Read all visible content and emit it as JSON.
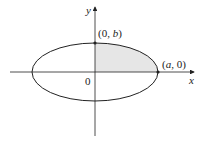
{
  "diagram": {
    "type": "ellipse-quadrant",
    "axes": {
      "x_label": "x",
      "y_label": "y",
      "origin_label": "0"
    },
    "points": [
      {
        "label_open": "(0, ",
        "label_var": "b",
        "label_close": ")",
        "role": "top-vertex"
      },
      {
        "label_open": "(",
        "label_var": "a",
        "label_close": ", 0)",
        "role": "right-vertex"
      }
    ],
    "colors": {
      "shaded_region": "#e6e6e6",
      "stroke": "#222222"
    }
  }
}
